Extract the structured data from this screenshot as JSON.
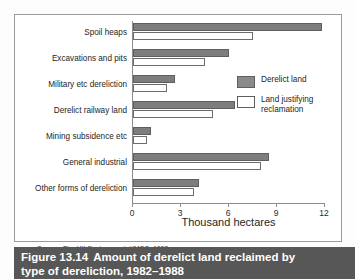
{
  "chart_data": {
    "type": "bar",
    "orientation": "horizontal",
    "title": "Amount of derelict land reclaimed by type of dereliction, 1982–1988",
    "xlabel": "Thousand hectares",
    "ylabel": "",
    "xlim": [
      0,
      12
    ],
    "xticks": [
      0,
      3,
      6,
      9,
      12
    ],
    "xtick_labels": [
      "0",
      "3",
      "6",
      "9",
      "12"
    ],
    "grid": false,
    "legend_position": "right",
    "categories": [
      "Spoil heaps",
      "Excavations and pits",
      "Military etc dereliction",
      "Derelict railway land",
      "Mining subsidence etc",
      "General industrial",
      "Other forms of dereliction"
    ],
    "series": [
      {
        "name": "Derelict land",
        "color": "#7d7d7d",
        "values": [
          11.8,
          6.0,
          2.6,
          6.4,
          1.1,
          8.5,
          4.1
        ]
      },
      {
        "name": "Land justifying reclamation",
        "color": "#ffffff",
        "values": [
          7.5,
          4.5,
          2.1,
          5.0,
          0.9,
          8.0,
          3.8
        ]
      }
    ]
  },
  "legend": {
    "items": [
      {
        "label": "Derelict land"
      },
      {
        "label": "Land justifying reclamation"
      }
    ]
  },
  "axis": {
    "title": "Thousand hectares"
  },
  "source": {
    "prefix": "Source:",
    "italic_title": "The UK Environment",
    "rest": ", HMSO, 1992"
  },
  "caption": {
    "figure_number": "Figure 13.14",
    "line1": "Amount of derelict land reclaimed by",
    "line2": "type of dereliction, 1982–1988"
  },
  "colors": {
    "derelict_fill": "#7d7d7d",
    "derelict_stroke": "#5e5e5e",
    "justifying_fill": "#ffffff",
    "justifying_stroke": "#6d6d6d",
    "axis": "#8d8d8d",
    "caption_bar": "#575757",
    "frame": "#9a9a9a"
  }
}
